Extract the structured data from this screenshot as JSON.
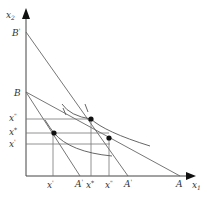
{
  "diagram": {
    "type": "budget-constraint-indifference-curves",
    "axes": {
      "y_label": "x",
      "y_sub": "2",
      "x_label": "x",
      "x_sub": "1"
    },
    "y_intercepts": [
      {
        "label": "B",
        "sup": "'"
      },
      {
        "label": "B",
        "sup": ""
      }
    ],
    "y_ticks": [
      {
        "label": "x",
        "sub": "2",
        "sup": "\""
      },
      {
        "label": "x",
        "sub": "2",
        "sup": "*"
      },
      {
        "label": "x",
        "sub": "2",
        "sup": "'"
      }
    ],
    "x_ticks": [
      {
        "label": "x",
        "sub": "1",
        "sup": "'"
      },
      {
        "label": "A",
        "sup": "'"
      },
      {
        "label": "x",
        "sub": "1",
        "sup": "*"
      },
      {
        "label": "x",
        "sub": "1",
        "sup": "\""
      },
      {
        "label": "A",
        "sup": "'"
      },
      {
        "label": "A",
        "sup": ""
      }
    ],
    "points": [
      "tangency-initial",
      "tangency-new",
      "compensated"
    ],
    "colors": {
      "line": "#555555",
      "point": "#111111",
      "text": "#333333"
    }
  }
}
